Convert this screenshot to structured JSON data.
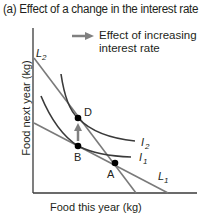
{
  "title": "(a) Effect of a change in the interest rate",
  "axes": {
    "ylabel": "Food next year (kg)",
    "xlabel": "Food this year (kg)"
  },
  "legend": {
    "arrow_icon": "right-arrow-icon",
    "text": "Effect of increasing interest rate",
    "color": "#808080"
  },
  "lines": {
    "L1": "L1",
    "L2": "L2"
  },
  "curves": {
    "I1": "I1",
    "I2": "I2"
  },
  "points": {
    "A": "A",
    "B": "B",
    "D": "D"
  },
  "colors": {
    "budget_line": "#7a7a7a",
    "indifference_curve": "#3a3a3a",
    "axis": "#3a3a3a",
    "point": "#000000",
    "arrow": "#808080"
  }
}
